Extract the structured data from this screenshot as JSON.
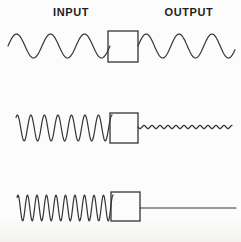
{
  "figure": {
    "labels": {
      "input": "INPUT",
      "output": "OUTPUT"
    },
    "colors": {
      "line": "#343434",
      "text": "#1e1e1e",
      "background": "#fcfcfc"
    },
    "rows": [
      {
        "id": "row-1-low-frequency",
        "description": "low frequency sine passes through unchanged",
        "input_wave": {
          "x1": 8,
          "x2": 110,
          "centerY": 46,
          "amplitude": 12,
          "cycles": 3.0,
          "phase": 0
        },
        "filter_box": {
          "x": 108,
          "y": 31,
          "w": 30,
          "h": 31
        },
        "output_wave": {
          "x1": 138,
          "x2": 235,
          "centerY": 46,
          "amplitude": 12,
          "cycles": 2.95,
          "phase": 0
        }
      },
      {
        "id": "row-2-mid-frequency",
        "description": "mid frequency sine strongly attenuated to small ripple",
        "input_wave": {
          "x1": 16,
          "x2": 112,
          "centerY": 128,
          "amplitude": 13,
          "cycles": 7.1,
          "phase": 0.15
        },
        "filter_box": {
          "x": 110,
          "y": 113,
          "w": 28,
          "h": 30
        },
        "output_wave": {
          "x1": 138,
          "x2": 232,
          "centerY": 127,
          "amplitude": 1.6,
          "cycles": 11.75,
          "phase": 0.5
        }
      },
      {
        "id": "row-3-high-frequency",
        "description": "high frequency sine completely blocked, flat output",
        "input_wave": {
          "x1": 17,
          "x2": 113,
          "centerY": 208,
          "amplitude": 13,
          "cycles": 10.1,
          "phase": 0.15
        },
        "filter_box": {
          "x": 111,
          "y": 192,
          "w": 29,
          "h": 29
        },
        "output_wave": {
          "x1": 140,
          "x2": 236,
          "centerY": 208,
          "amplitude": 0,
          "cycles": 0,
          "phase": 0
        }
      }
    ]
  }
}
